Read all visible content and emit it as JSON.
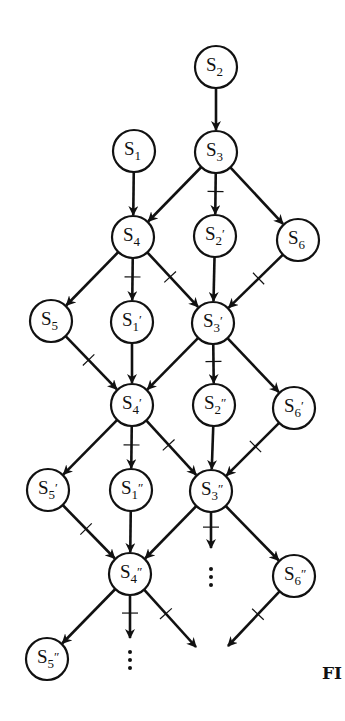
{
  "figure": {
    "caption_fragment": "FI",
    "colors": {
      "ink": "#111111",
      "background": "#ffffff"
    },
    "node_radius": 21
  },
  "nodes": [
    {
      "id": "S2",
      "base": "S",
      "sub": "2",
      "prime": "",
      "x": 216,
      "y": 67
    },
    {
      "id": "S1",
      "base": "S",
      "sub": "1",
      "prime": "",
      "x": 134,
      "y": 151
    },
    {
      "id": "S3",
      "base": "S",
      "sub": "3",
      "prime": "",
      "x": 216,
      "y": 152
    },
    {
      "id": "S4",
      "base": "S",
      "sub": "4",
      "prime": "",
      "x": 133,
      "y": 237
    },
    {
      "id": "S2p",
      "base": "S",
      "sub": "2",
      "prime": "′",
      "x": 215,
      "y": 236
    },
    {
      "id": "S6",
      "base": "S",
      "sub": "6",
      "prime": "",
      "x": 298,
      "y": 240
    },
    {
      "id": "S5",
      "base": "S",
      "sub": "5",
      "prime": "",
      "x": 51,
      "y": 321
    },
    {
      "id": "S1p",
      "base": "S",
      "sub": "1",
      "prime": "′",
      "x": 132,
      "y": 322
    },
    {
      "id": "S3p",
      "base": "S",
      "sub": "3",
      "prime": "′",
      "x": 213,
      "y": 323
    },
    {
      "id": "S4p",
      "base": "S",
      "sub": "4",
      "prime": "′",
      "x": 132,
      "y": 405
    },
    {
      "id": "S2pp",
      "base": "S",
      "sub": "2",
      "prime": "″",
      "x": 214,
      "y": 405
    },
    {
      "id": "S6p",
      "base": "S",
      "sub": "6",
      "prime": "′",
      "x": 294,
      "y": 408
    },
    {
      "id": "S5p",
      "base": "S",
      "sub": "5",
      "prime": "′",
      "x": 48,
      "y": 490
    },
    {
      "id": "S1pp",
      "base": "S",
      "sub": "1",
      "prime": "″",
      "x": 131,
      "y": 490
    },
    {
      "id": "S3pp",
      "base": "S",
      "sub": "3",
      "prime": "″",
      "x": 211,
      "y": 491
    },
    {
      "id": "S4pp",
      "base": "S",
      "sub": "4",
      "prime": "″",
      "x": 130,
      "y": 574
    },
    {
      "id": "S6pp",
      "base": "S",
      "sub": "6",
      "prime": "″",
      "x": 294,
      "y": 576
    },
    {
      "id": "S5pp",
      "base": "S",
      "sub": "5",
      "prime": "″",
      "x": 47,
      "y": 659
    }
  ],
  "edges": [
    {
      "from": "S2",
      "to": "S3",
      "tick": false
    },
    {
      "from": "S1",
      "to": "S4",
      "tick": false
    },
    {
      "from": "S3",
      "to": "S4",
      "tick": false
    },
    {
      "from": "S3",
      "to": "S2p",
      "tick": true
    },
    {
      "from": "S3",
      "to": "S6",
      "tick": false
    },
    {
      "from": "S4",
      "to": "S5",
      "tick": false
    },
    {
      "from": "S4",
      "to": "S1p",
      "tick": true
    },
    {
      "from": "S4",
      "to": "S3p",
      "tick": true
    },
    {
      "from": "S2p",
      "to": "S3p",
      "tick": false
    },
    {
      "from": "S6",
      "to": "S3p",
      "tick": true
    },
    {
      "from": "S5",
      "to": "S4p",
      "tick": true
    },
    {
      "from": "S1p",
      "to": "S4p",
      "tick": false
    },
    {
      "from": "S3p",
      "to": "S4p",
      "tick": false
    },
    {
      "from": "S3p",
      "to": "S2pp",
      "tick": true
    },
    {
      "from": "S3p",
      "to": "S6p",
      "tick": false
    },
    {
      "from": "S4p",
      "to": "S5p",
      "tick": false
    },
    {
      "from": "S4p",
      "to": "S1pp",
      "tick": true
    },
    {
      "from": "S4p",
      "to": "S3pp",
      "tick": true
    },
    {
      "from": "S2pp",
      "to": "S3pp",
      "tick": false
    },
    {
      "from": "S6p",
      "to": "S3pp",
      "tick": true
    },
    {
      "from": "S5p",
      "to": "S4pp",
      "tick": true
    },
    {
      "from": "S1pp",
      "to": "S4pp",
      "tick": false
    },
    {
      "from": "S3pp",
      "to": "S4pp",
      "tick": false
    },
    {
      "from": "S3pp",
      "to": "S6pp",
      "tick": false
    },
    {
      "from": "S4pp",
      "to": "S5pp",
      "tick": false
    }
  ],
  "open_edges": [
    {
      "from": "S3pp",
      "end_x": 211,
      "end_y": 548,
      "tick": true,
      "continuation": "⋮"
    },
    {
      "from": "S4pp",
      "end_x": 130,
      "end_y": 638,
      "tick": true,
      "continuation": "⋮"
    },
    {
      "from": "S4pp",
      "end_x": 196,
      "end_y": 647,
      "tick": true,
      "continuation": ""
    },
    {
      "from": "S6pp",
      "end_x": 228,
      "end_y": 646,
      "tick": true,
      "continuation": ""
    }
  ],
  "continuation_dots": [
    {
      "x": 211,
      "y": 577
    },
    {
      "x": 130,
      "y": 660
    }
  ]
}
